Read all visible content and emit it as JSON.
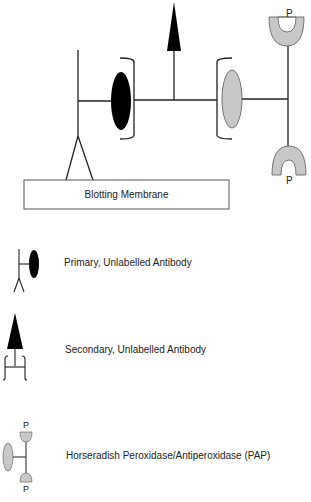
{
  "diagram": {
    "title": "",
    "membrane": {
      "label": "Blotting Membrane"
    },
    "nodes": [
      {
        "id": "primary",
        "shape": "y-antibody-with-black-ellipse",
        "color": "#000000"
      },
      {
        "id": "secondary",
        "shape": "black-triangle-bridge",
        "color": "#000000"
      },
      {
        "id": "pap",
        "shape": "grey-ellipse-with-two-peroxidase-cups",
        "color": "#c8c8c8"
      }
    ],
    "peroxidase_labels": [
      "P",
      "P"
    ],
    "colors": {
      "dark": "#000000",
      "grey": "#c8c8c8",
      "line": "#222222"
    }
  },
  "legend": {
    "items": [
      {
        "label": "Primary, Unlabelled Antibody",
        "icon": "primary-antibody-icon"
      },
      {
        "label": "Secondary, Unlabelled Antibody",
        "icon": "secondary-antibody-icon"
      },
      {
        "label": "Horseradish Peroxidase/Antiperoxidase (PAP)",
        "icon": "pap-complex-icon"
      }
    ],
    "pap_p_labels": [
      "P",
      "P"
    ]
  }
}
